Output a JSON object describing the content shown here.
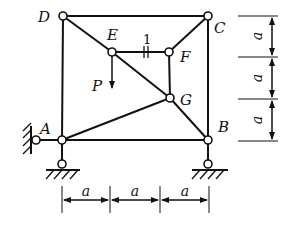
{
  "diagram": {
    "title": "",
    "nodes": {
      "A": {
        "label": "A",
        "x": 62,
        "y": 140
      },
      "B": {
        "label": "B",
        "x": 208,
        "y": 140
      },
      "C": {
        "label": "C",
        "x": 208,
        "y": 16
      },
      "D": {
        "label": "D",
        "x": 63,
        "y": 16
      },
      "E": {
        "label": "E",
        "x": 112,
        "y": 52
      },
      "F": {
        "label": "F",
        "x": 169,
        "y": 52
      },
      "G": {
        "label": "G",
        "x": 170,
        "y": 98
      }
    },
    "members": [
      [
        "D",
        "C"
      ],
      [
        "D",
        "A"
      ],
      [
        "C",
        "B"
      ],
      [
        "A",
        "B"
      ],
      [
        "D",
        "E"
      ],
      [
        "E",
        "G"
      ],
      [
        "G",
        "B"
      ],
      [
        "E",
        "F"
      ],
      [
        "F",
        "C"
      ],
      [
        "F",
        "G"
      ],
      [
        "A",
        "G"
      ]
    ],
    "member_label": "1",
    "load": {
      "label": "P",
      "at": "E",
      "direction": "down"
    },
    "supports": [
      {
        "type": "pin-wall-left",
        "at": "A"
      },
      {
        "type": "pin-ground",
        "at": "A"
      },
      {
        "type": "pin-ground",
        "at": "B"
      }
    ],
    "dimensions": {
      "horizontal": [
        "a",
        "a",
        "a"
      ],
      "vertical": [
        "a",
        "a",
        "a"
      ]
    }
  }
}
